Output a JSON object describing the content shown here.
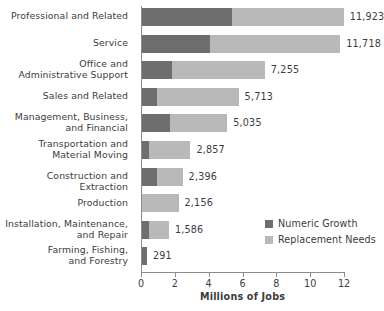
{
  "chart_data": {
    "type": "bar",
    "orientation": "horizontal",
    "stacked": true,
    "title": "",
    "xlabel": "Millions of Jobs",
    "ylabel": "",
    "xlim": [
      0,
      12
    ],
    "xticks": [
      0,
      2,
      4,
      6,
      8,
      10,
      12
    ],
    "xtick_labels": [
      "0",
      "2",
      "4",
      "6",
      "8",
      "10",
      "12"
    ],
    "grid": false,
    "legend_position": "inside-right",
    "value_unit": "thousands of jobs",
    "categories": [
      "Professional and Related",
      "Service",
      "Office and Administrative Support",
      "Sales and Related",
      "Management, Business, and Financial",
      "Transportation and Material Moving",
      "Construction and Extraction",
      "Production",
      "Installation, Maintenance, and Repair",
      "Farming, Fishing, and Forestry"
    ],
    "series": [
      {
        "name": "Numeric Growth",
        "color": "#6e6e6e",
        "values": [
          5.3,
          4.0,
          1.75,
          0.9,
          1.65,
          0.4,
          0.9,
          0.0,
          0.4,
          0.29
        ]
      },
      {
        "name": "Replacement Needs",
        "color": "#b9b9b9",
        "values": [
          6.62,
          7.72,
          5.51,
          4.81,
          3.39,
          2.46,
          1.5,
          2.16,
          1.19,
          0.0
        ]
      }
    ],
    "totals": [
      11.923,
      11.718,
      7.255,
      5.713,
      5.035,
      2.857,
      2.396,
      2.156,
      1.586,
      0.291
    ],
    "total_labels": [
      "11,923",
      "11,718",
      "7,255",
      "5,713",
      "5,035",
      "2,857",
      "2,396",
      "2,156",
      "1,586",
      "291"
    ]
  },
  "categories_display": [
    {
      "lines": [
        "Professional and Related"
      ]
    },
    {
      "lines": [
        "Service"
      ]
    },
    {
      "lines": [
        "Office and",
        "Administrative Support"
      ]
    },
    {
      "lines": [
        "Sales and Related"
      ]
    },
    {
      "lines": [
        "Management, Business,",
        "and Financial"
      ]
    },
    {
      "lines": [
        "Transportation and",
        "Material Moving"
      ]
    },
    {
      "lines": [
        "Construction and Extraction"
      ]
    },
    {
      "lines": [
        "Production"
      ]
    },
    {
      "lines": [
        "Installation, Maintenance,",
        "and Repair"
      ]
    },
    {
      "lines": [
        "Farming, Fishing,",
        "and Forestry"
      ]
    }
  ],
  "legend": {
    "items": [
      {
        "label": "Numeric Growth",
        "color": "#6e6e6e"
      },
      {
        "label": "Replacement Needs",
        "color": "#b9b9b9"
      }
    ]
  },
  "axis": {
    "x_title": "Millions of Jobs"
  },
  "colors": {
    "growth": "#6e6e6e",
    "replacement": "#b9b9b9",
    "axis": "#8c8c8c",
    "text": "#3c3c3c",
    "background": "#ffffff"
  }
}
